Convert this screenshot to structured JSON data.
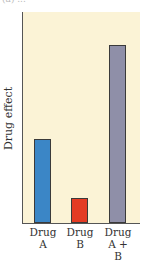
{
  "chart_data": {
    "type": "bar",
    "title": "",
    "xlabel": "",
    "ylabel": "Drug effect",
    "categories": [
      "Drug A",
      "Drug B",
      "Drug A + B"
    ],
    "category_lines": [
      [
        "Drug",
        "A"
      ],
      [
        "Drug",
        "B"
      ],
      [
        "Drug",
        "A + B"
      ]
    ],
    "values": [
      84,
      25,
      178
    ],
    "colors": [
      "#3b86c6",
      "#e43b24",
      "#8f8fa8"
    ],
    "ylim": [
      0,
      212
    ],
    "grid": false,
    "legend": null,
    "note": "No numeric y-axis ticks; values are relative bar heights in pixels"
  },
  "caption": "(a) ..."
}
